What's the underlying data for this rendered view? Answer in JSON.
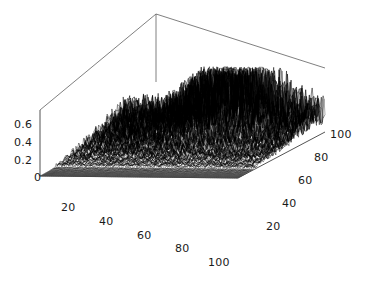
{
  "chart_data": {
    "type": "surface",
    "title": "",
    "xlabel": "",
    "ylabel": "",
    "zlabel": "",
    "grid": false,
    "legend": false,
    "style": "3d mesh surface, black wireframe on white background",
    "colors": {
      "background": "#ffffff",
      "mesh": "#000000",
      "box_edge": "#555555",
      "tick_text": "#1a1a1a"
    },
    "axes": {
      "z": {
        "ticks": [
          0,
          0.2,
          0.4,
          0.6
        ],
        "tick_labels": [
          "0",
          "0.2",
          "0.4",
          "0.6"
        ],
        "range": [
          0,
          0.7
        ]
      },
      "x": {
        "ticks": [
          20,
          40,
          60,
          80,
          100
        ],
        "tick_labels": [
          "20",
          "40",
          "60",
          "80",
          "100"
        ],
        "range": [
          0,
          110
        ]
      },
      "y": {
        "ticks": [
          20,
          40,
          60,
          80,
          100
        ],
        "tick_labels": [
          "20",
          "40",
          "60",
          "80",
          "100"
        ],
        "range": [
          0,
          110
        ]
      }
    },
    "surface_summary": {
      "z_min": 0,
      "z_max": 0.68,
      "peak_region": "back-centre, around x=45-70, y=75-100",
      "flat_region": "foreground, low x and low y"
    }
  },
  "z_labels": [
    {
      "text": "0.6",
      "x": 14,
      "y": 119
    },
    {
      "text": "0.4",
      "x": 14,
      "y": 137
    },
    {
      "text": "0.2",
      "x": 14,
      "y": 155
    },
    {
      "text": "0",
      "x": 34,
      "y": 172
    }
  ],
  "x_labels": [
    {
      "text": "20",
      "x": 61,
      "y": 202
    },
    {
      "text": "40",
      "x": 99,
      "y": 216
    },
    {
      "text": "60",
      "x": 137,
      "y": 230
    },
    {
      "text": "80",
      "x": 175,
      "y": 243
    },
    {
      "text": "100",
      "x": 208,
      "y": 257
    }
  ],
  "y_labels": [
    {
      "text": "100",
      "x": 330,
      "y": 129
    },
    {
      "text": "80",
      "x": 314,
      "y": 152
    },
    {
      "text": "60",
      "x": 298,
      "y": 175
    },
    {
      "text": "40",
      "x": 282,
      "y": 198
    },
    {
      "text": "20",
      "x": 266,
      "y": 221
    }
  ]
}
